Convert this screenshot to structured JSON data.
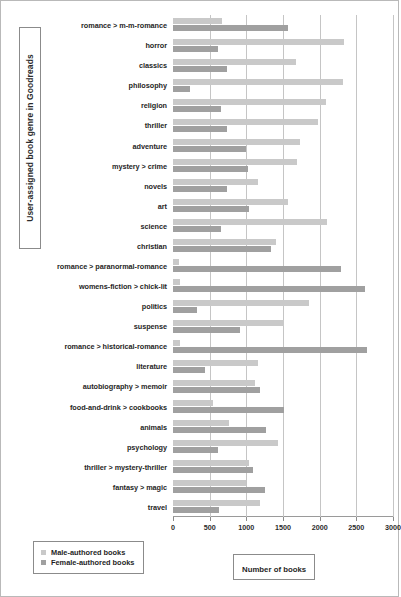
{
  "chart_data": {
    "type": "bar",
    "orientation": "horizontal",
    "title": "",
    "xlabel": "Number of books",
    "ylabel": "User-assigned book genre in Goodreads",
    "xlim": [
      0,
      3000
    ],
    "xticks": [
      0,
      500,
      1000,
      1500,
      2000,
      2500,
      3000
    ],
    "grid": true,
    "legend_position": "bottom-left",
    "categories": [
      "romance > m-m-romance",
      "horror",
      "classics",
      "philosophy",
      "religion",
      "thriller",
      "adventure",
      "mystery > crime",
      "novels",
      "art",
      "science",
      "christian",
      "romance > paranormal-romance",
      "womens-fiction > chick-lit",
      "politics",
      "suspense",
      "romance > historical-romance",
      "literature",
      "autobiography > memoir",
      "food-and-drink > cookbooks",
      "animals",
      "psychology",
      "thriller > mystery-thriller",
      "fantasy > magic",
      "travel"
    ],
    "series": [
      {
        "name": "Male-authored books",
        "color": "#c9c9c9",
        "values": [
          670,
          2330,
          1680,
          2320,
          2090,
          1980,
          1730,
          1690,
          1160,
          1570,
          2100,
          1400,
          80,
          90,
          1855,
          1520,
          100,
          1160,
          1120,
          540,
          760,
          1430,
          1030,
          1000,
          1180
        ]
      },
      {
        "name": "Female-authored books",
        "color": "#a0a0a0",
        "values": [
          1570,
          610,
          740,
          230,
          655,
          740,
          1000,
          1020,
          730,
          1030,
          660,
          1340,
          2290,
          2620,
          330,
          910,
          2640,
          440,
          1190,
          1520,
          1270,
          620,
          1090,
          1250,
          630
        ]
      }
    ]
  },
  "legend": {
    "items": [
      {
        "label": "Male-authored books",
        "swatch": "male"
      },
      {
        "label": "Female-authored books",
        "swatch": "female"
      }
    ]
  },
  "axis_titles": {
    "x": "Number of books",
    "y": "User-assigned book genre in Goodreads"
  }
}
